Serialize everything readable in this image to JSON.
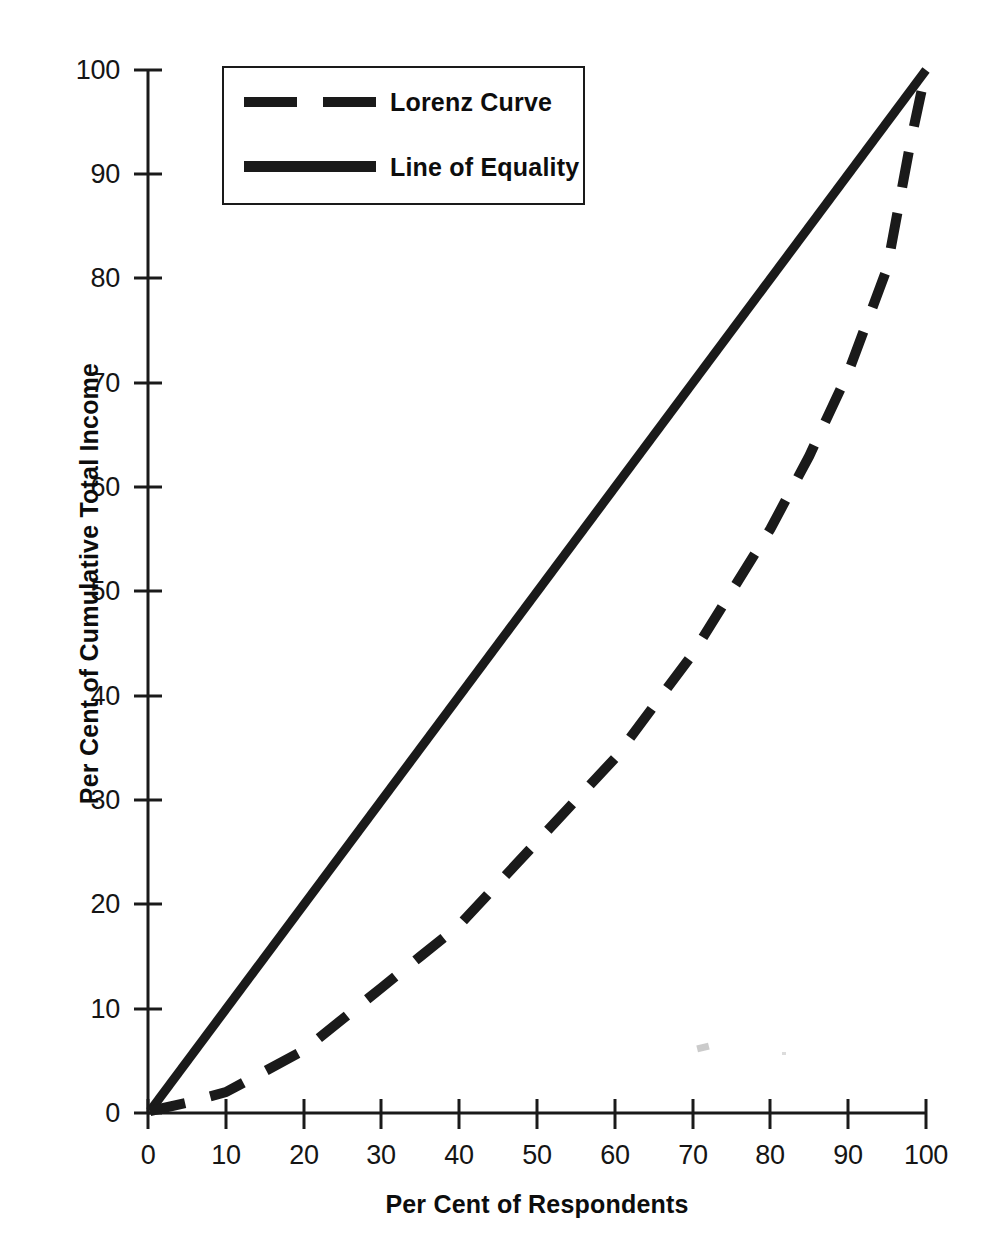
{
  "figure": {
    "top_bleed_text": " "
  },
  "legend": {
    "position": "upper-left-inside",
    "entries": [
      {
        "label": "Lorenz Curve",
        "style": "dashed",
        "swatch_name": "dashed-line-swatch"
      },
      {
        "label": "Line of Equality",
        "style": "solid",
        "swatch_name": "solid-line-swatch"
      }
    ]
  },
  "axes": {
    "x_title": "Per Cent of Respondents",
    "y_title": "Per Cent of Cumulative Total Income",
    "x_ticks": [
      "0",
      "10",
      "20",
      "30",
      "40",
      "50",
      "60",
      "70",
      "80",
      "90",
      "100"
    ],
    "y_ticks": [
      "0",
      "10",
      "20",
      "30",
      "40",
      "50",
      "60",
      "70",
      "80",
      "90",
      "100"
    ]
  },
  "colors": {
    "line": "#1a1a1a",
    "axis": "#1a1a1a",
    "text": "#0d0d0d",
    "background": "#ffffff"
  },
  "chart_data": {
    "type": "line",
    "title": "",
    "subtitle": "",
    "xlabel": "Per Cent of Respondents",
    "ylabel": "Per Cent of Cumulative Total Income",
    "xlim": [
      0,
      100
    ],
    "ylim": [
      0,
      100
    ],
    "xticks": [
      0,
      10,
      20,
      30,
      40,
      50,
      60,
      70,
      80,
      90,
      100
    ],
    "yticks": [
      0,
      10,
      20,
      30,
      40,
      50,
      60,
      70,
      80,
      90,
      100
    ],
    "grid": false,
    "legend_position": "upper left",
    "annotations": [],
    "series": [
      {
        "name": "Line of Equality",
        "style": "solid",
        "linewidth": 9,
        "x": [
          0,
          100
        ],
        "y": [
          0,
          100
        ]
      },
      {
        "name": "Lorenz Curve",
        "style": "dashed",
        "linewidth": 10,
        "x": [
          0,
          5,
          10,
          15,
          20,
          25,
          30,
          35,
          40,
          45,
          50,
          55,
          60,
          65,
          70,
          75,
          80,
          85,
          90,
          95,
          98,
          100
        ],
        "y": [
          0,
          1,
          2,
          4,
          6,
          9,
          12,
          15,
          18,
          22,
          26,
          30,
          34,
          39,
          44,
          50,
          56,
          63,
          71,
          81,
          93,
          100
        ]
      }
    ]
  }
}
